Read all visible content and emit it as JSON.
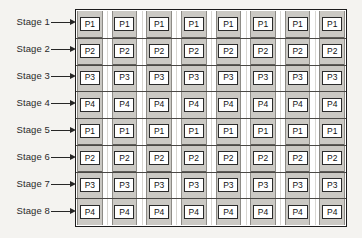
{
  "diagram": {
    "stage_labels": [
      "Stage 1",
      "Stage 2",
      "Stage 3",
      "Stage 4",
      "Stage 5",
      "Stage 6",
      "Stage 7",
      "Stage 8"
    ],
    "arrow_icon": "right-arrow-icon",
    "rows": 8,
    "columns": 8,
    "process_matrix": [
      [
        "P1",
        "P1",
        "P1",
        "P1",
        "P1",
        "P1",
        "P1",
        "P1"
      ],
      [
        "P2",
        "P2",
        "P2",
        "P2",
        "P2",
        "P2",
        "P2",
        "P2"
      ],
      [
        "P3",
        "P3",
        "P3",
        "P3",
        "P3",
        "P3",
        "P3",
        "P3"
      ],
      [
        "P4",
        "P4",
        "P4",
        "P4",
        "P4",
        "P4",
        "P4",
        "P4"
      ],
      [
        "P1",
        "P1",
        "P1",
        "P1",
        "P1",
        "P1",
        "P1",
        "P1"
      ],
      [
        "P2",
        "P2",
        "P2",
        "P2",
        "P2",
        "P2",
        "P2",
        "P2"
      ],
      [
        "P3",
        "P3",
        "P3",
        "P3",
        "P3",
        "P3",
        "P3",
        "P3"
      ],
      [
        "P4",
        "P4",
        "P4",
        "P4",
        "P4",
        "P4",
        "P4",
        "P4"
      ]
    ],
    "colors": {
      "background": "#f4f3f0",
      "column_band": "#cbc9c4",
      "box_fill": "#ffffff",
      "box_border": "#2b2b2b",
      "outer_border": "#1c1c1c",
      "divider": "#4a4845",
      "text": "#111111"
    }
  }
}
